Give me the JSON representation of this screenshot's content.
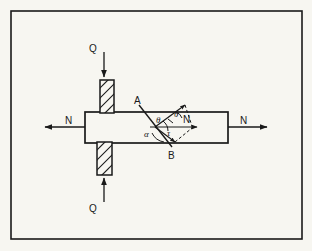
{
  "figure": {
    "background_color": "#f7f6f1",
    "line_color": "#1a1a1a",
    "frame": {
      "name": "figure-border",
      "x": 11,
      "y": 11,
      "width": 291,
      "height": 228,
      "stroke_width": 1.6
    },
    "bar": {
      "name": "specimen-bar",
      "x": 85,
      "y": 112,
      "width": 143,
      "height": 31,
      "stroke_width": 1.6
    },
    "blocks": [
      {
        "name": "upper-hatched-block",
        "x": 100,
        "y": 80,
        "width": 14,
        "height": 33,
        "hatch": "diagonal"
      },
      {
        "name": "lower-hatched-block",
        "x": 97,
        "y": 142,
        "width": 15,
        "height": 33,
        "hatch": "diagonal"
      }
    ],
    "section_line": {
      "name": "inclined-section-ab",
      "x1": 139,
      "y1": 106,
      "x2": 172,
      "y2": 148
    }
  },
  "labels": {
    "force_q_top": "Q",
    "force_q_bottom": "Q",
    "force_n_left": "N",
    "force_n_right": "N",
    "point_a": "A",
    "point_b": "B",
    "angle_theta": "θ",
    "angle_theta_2": "θ",
    "angle_alpha": "α",
    "stress_normal": "N",
    "stress_shear": "τ"
  },
  "arrows": [
    {
      "name": "arrow-q-top",
      "label": "Q",
      "direction": "down",
      "from": [
        104,
        52
      ],
      "to": [
        104,
        78
      ],
      "label_pos": [
        92,
        49
      ]
    },
    {
      "name": "arrow-q-bottom",
      "label": "Q",
      "direction": "up",
      "from": [
        104,
        202
      ],
      "to": [
        104,
        177
      ],
      "label_pos": [
        92,
        209
      ]
    },
    {
      "name": "arrow-n-left",
      "label": "N",
      "direction": "left",
      "from": [
        85,
        127
      ],
      "to": [
        44,
        127
      ],
      "label_pos": [
        69,
        121
      ]
    },
    {
      "name": "arrow-n-right",
      "label": "N",
      "direction": "right",
      "from": [
        228,
        127
      ],
      "to": [
        268,
        127
      ],
      "label_pos": [
        243,
        121
      ]
    }
  ]
}
